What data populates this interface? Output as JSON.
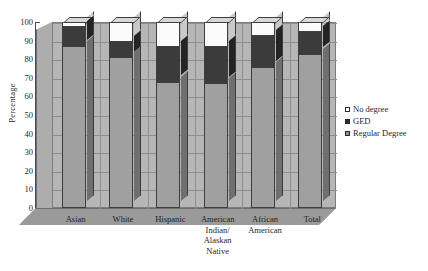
{
  "chart_data": {
    "type": "bar",
    "subtype": "stacked-column-3d",
    "title": "",
    "xlabel": "",
    "ylabel": "Percentage",
    "ylim": [
      0,
      100
    ],
    "yticks": [
      0,
      10,
      20,
      30,
      40,
      50,
      60,
      70,
      80,
      90,
      100
    ],
    "grid": true,
    "legend_position": "right",
    "categories": [
      "Asian",
      "White",
      "Hispanic",
      "American Indian/ Alaskan Native",
      "African American",
      "Total"
    ],
    "category_lines": [
      [
        "Asian"
      ],
      [
        "White"
      ],
      [
        "Hispanic"
      ],
      [
        "American",
        "Indian/",
        "Alaskan",
        "Native"
      ],
      [
        "African",
        "American"
      ],
      [
        "Total"
      ]
    ],
    "series": [
      {
        "name": "Regular Degree",
        "color": "#a0a0a0",
        "values": [
          87,
          81,
          68,
          67,
          76,
          83
        ]
      },
      {
        "name": "GED",
        "color": "#3b3b3b",
        "values": [
          11,
          9,
          19,
          20,
          17,
          12
        ]
      },
      {
        "name": "No degree",
        "color": "#ffffff",
        "values": [
          2,
          10,
          13,
          13,
          7,
          5
        ]
      }
    ],
    "stack_tops": {
      "Regular Degree": [
        87,
        81,
        68,
        67,
        76,
        83
      ],
      "GED": [
        98,
        90,
        87,
        87,
        93,
        95
      ],
      "No degree": [
        100,
        100,
        100,
        100,
        100,
        100
      ]
    }
  },
  "legend": {
    "items": [
      {
        "label": "No degree",
        "swatch": "sw-none"
      },
      {
        "label": "GED",
        "swatch": "sw-ged"
      },
      {
        "label": "Regular Degree",
        "swatch": "sw-regular"
      }
    ]
  },
  "axis": {
    "y_title": "Percentage"
  }
}
